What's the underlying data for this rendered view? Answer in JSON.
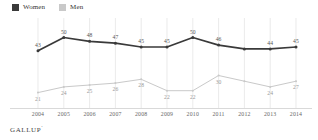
{
  "legend": {
    "items": [
      {
        "label": "Women",
        "color": "#3a3a3a",
        "key": "women"
      },
      {
        "label": "Men",
        "color": "#c9c9c9",
        "key": "men"
      }
    ]
  },
  "footer": {
    "brand": "GALLUP",
    "mark": "’"
  },
  "chart_data": {
    "type": "line",
    "title": "",
    "subtitle": "",
    "xlabel": "",
    "ylabel": "",
    "grid": "vertical",
    "legend_position": "top-left",
    "ylim": [
      15,
      55
    ],
    "categories": [
      "2004",
      "2005",
      "2006",
      "2007",
      "2008",
      "2009",
      "2010",
      "2011",
      "2012",
      "2013",
      "2014"
    ],
    "series": [
      {
        "name": "Women",
        "color": "#3a3a3a",
        "values": [
          43,
          50,
          48,
          47,
          45,
          45,
          50,
          46,
          44,
          44,
          45
        ],
        "labels": [
          "43",
          "50",
          "48",
          "47",
          "45",
          "45",
          "50",
          "46",
          "",
          "44",
          "45"
        ]
      },
      {
        "name": "Men",
        "color": "#c9c9c9",
        "values": [
          21,
          24,
          25,
          26,
          28,
          22,
          22,
          30,
          27,
          24,
          27
        ],
        "labels": [
          "21",
          "24",
          "25",
          "26",
          "28",
          "22",
          "22",
          "30",
          "",
          "24",
          "27"
        ]
      }
    ]
  }
}
